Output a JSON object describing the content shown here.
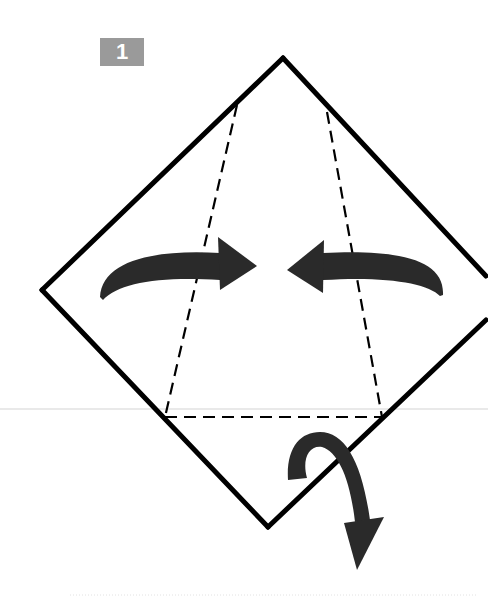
{
  "diagram": {
    "type": "origami-step",
    "step": {
      "number": "1",
      "badge_color": "#9a9a9a",
      "badge_text_color": "#ffffff"
    },
    "paper": {
      "shape": "square rotated 45deg (diamond)",
      "vertices": {
        "top": [
          283,
          58
        ],
        "left": [
          42,
          290
        ],
        "bottom": [
          268,
          527
        ],
        "right": [
          488,
          300
        ]
      },
      "edge_color": "#000000"
    },
    "fold_lines": [
      {
        "name": "left-valley-fold",
        "style": "dashed",
        "from": [
          237,
          105
        ],
        "to": [
          165,
          417
        ]
      },
      {
        "name": "right-valley-fold",
        "style": "dashed",
        "from": [
          327,
          112
        ],
        "to": [
          382,
          417
        ]
      },
      {
        "name": "bottom-fold",
        "style": "dashed",
        "from": [
          165,
          417
        ],
        "to": [
          382,
          417
        ]
      }
    ],
    "arrows": [
      {
        "name": "fold-left-flap-in",
        "direction": "right",
        "meaning": "fold side to center"
      },
      {
        "name": "fold-right-flap-in",
        "direction": "left",
        "meaning": "fold side to center"
      },
      {
        "name": "fold-bottom-behind",
        "direction": "down-behind",
        "meaning": "fold bottom point behind"
      }
    ],
    "rules": {
      "page_divider_y": 409,
      "page_divider_color": "#d0d0d0",
      "footer_dotted_y": 595,
      "footer_dotted_color": "#e0e0e0"
    },
    "arrow_color": "#2a2a2a"
  }
}
